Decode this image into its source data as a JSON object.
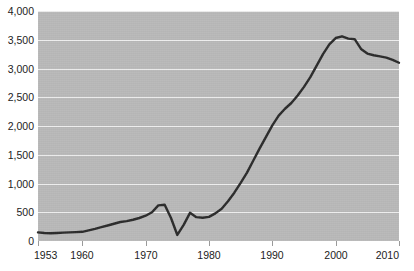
{
  "chart_data": {
    "type": "line",
    "title": "",
    "xlabel": "",
    "ylabel": "",
    "xlim": [
      1953,
      2010
    ],
    "ylim": [
      0,
      4000
    ],
    "grid": true,
    "legend": null,
    "y_ticks": [
      0,
      500,
      1000,
      1500,
      2000,
      2500,
      3000,
      3500,
      4000
    ],
    "y_tick_labels": [
      "0",
      "500",
      "1,000",
      "1,500",
      "2,000",
      "2,500",
      "3,000",
      "3,500",
      "4,000"
    ],
    "x_ticks": [
      1953,
      1960,
      1970,
      1980,
      1990,
      2000,
      2010
    ],
    "x_tick_labels": [
      "1953",
      "1960",
      "1970",
      "1980",
      "1990",
      "2000",
      "2010"
    ],
    "colors": {
      "plot_background": "#b9b9b9",
      "gridline": "#eeeeee",
      "line": "#2b2b2b",
      "page_background": "#ffffff",
      "tick_text": "#222222"
    },
    "series": [
      {
        "name": "series-1",
        "x": [
          1953,
          1954,
          1955,
          1956,
          1957,
          1958,
          1959,
          1960,
          1961,
          1962,
          1963,
          1964,
          1965,
          1966,
          1967,
          1968,
          1969,
          1970,
          1971,
          1972,
          1973,
          1974,
          1975,
          1976,
          1977,
          1978,
          1979,
          1980,
          1981,
          1982,
          1983,
          1984,
          1985,
          1986,
          1987,
          1988,
          1989,
          1990,
          1991,
          1992,
          1993,
          1994,
          1995,
          1996,
          1997,
          1998,
          1999,
          2000,
          2001,
          2002,
          2003,
          2004,
          2005,
          2006,
          2007,
          2008,
          2009,
          2010
        ],
        "values": [
          150,
          140,
          135,
          140,
          145,
          150,
          155,
          160,
          185,
          210,
          240,
          270,
          300,
          330,
          345,
          370,
          400,
          440,
          500,
          620,
          630,
          400,
          105,
          280,
          490,
          415,
          405,
          420,
          480,
          560,
          690,
          840,
          1010,
          1190,
          1400,
          1610,
          1810,
          2010,
          2180,
          2300,
          2400,
          2530,
          2680,
          2850,
          3050,
          3250,
          3420,
          3530,
          3560,
          3520,
          3510,
          3340,
          3260,
          3230,
          3210,
          3190,
          3150,
          3100
        ]
      }
    ]
  }
}
